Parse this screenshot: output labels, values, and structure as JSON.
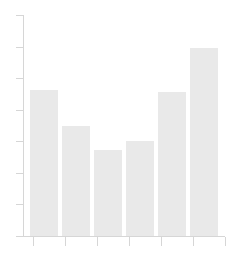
{
  "chart_data": {
    "type": "bar",
    "title": "",
    "subtitle": "",
    "xlabel": "",
    "ylabel": "",
    "categories": [
      "",
      "",
      "",
      "",
      "",
      ""
    ],
    "values": [
      66,
      50,
      39,
      43,
      65,
      85
    ],
    "ylim": [
      0,
      100
    ],
    "y_tick_values": [
      100,
      87,
      73,
      58,
      44,
      29,
      15,
      0
    ],
    "y_tick_labels": [
      "",
      "",
      "",
      "",
      "",
      "",
      "",
      ""
    ],
    "x_tick_labels": [
      "",
      "",
      "",
      "",
      "",
      "",
      ""
    ],
    "grid": false,
    "legend": null,
    "annotations": [],
    "bar_color": "#e9e9e9",
    "axis_color": "#d6d6d6",
    "background_color": "#ffffff",
    "bar_count": 6,
    "y_tick_count": 8,
    "x_tick_count": 7
  },
  "figure": {
    "width": 232,
    "height": 263
  }
}
